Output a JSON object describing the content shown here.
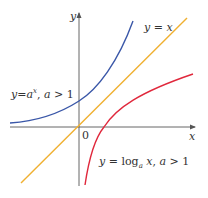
{
  "diagram": {
    "type": "function-graph",
    "axes": {
      "x_label": "x",
      "y_label": "y",
      "origin_label": "0"
    },
    "curves": [
      {
        "name": "exponential",
        "label_y": "y",
        "label_eq": "=",
        "label_base": "a",
        "label_exp": "x",
        "label_sep": ",",
        "label_cond_var": "a",
        "label_cond_op": ">",
        "label_cond_val": "1",
        "color": "#3a57a8"
      },
      {
        "name": "identity",
        "label_y": "y",
        "label_eq": "=",
        "label_rhs": "x",
        "color": "#f0b030"
      },
      {
        "name": "logarithm",
        "label_y": "y",
        "label_eq": "=",
        "label_log": "log",
        "label_sub": "a",
        "label_arg": "x",
        "label_sep": ",",
        "label_cond_var": "a",
        "label_cond_op": ">",
        "label_cond_val": "1",
        "color": "#e0283c"
      }
    ],
    "axis_color": "#555555"
  }
}
